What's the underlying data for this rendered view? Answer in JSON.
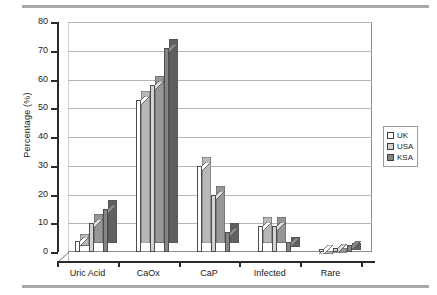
{
  "chart_data": {
    "type": "bar",
    "title": "",
    "xlabel": "",
    "ylabel": "Percentage (%)",
    "categories": [
      "Uric Acid",
      "CaOx",
      "CaP",
      "Infected",
      "Rare"
    ],
    "series": [
      {
        "name": "UK",
        "values": [
          4,
          53,
          30,
          9,
          1
        ],
        "color": "#ffffff"
      },
      {
        "name": "USA",
        "values": [
          10,
          58,
          20,
          9,
          1.5
        ],
        "color": "#d2d2d2"
      },
      {
        "name": "KSA",
        "values": [
          15,
          71,
          7,
          3.5,
          2.5
        ],
        "color": "#858585"
      }
    ],
    "ylim": [
      0,
      80
    ],
    "yticks": [
      0,
      10,
      20,
      30,
      40,
      50,
      60,
      70,
      80
    ],
    "ytick_labels": [
      "0",
      "10",
      "20",
      "30",
      "40",
      "50",
      "60",
      "70",
      "80"
    ],
    "grid": true,
    "legend_position": "right",
    "style": "3d-column"
  },
  "legend": {
    "entries": [
      {
        "label": "UK"
      },
      {
        "label": "USA"
      },
      {
        "label": "KSA"
      }
    ]
  },
  "decorations": {
    "top_rule": "",
    "bottom_rule": ""
  }
}
